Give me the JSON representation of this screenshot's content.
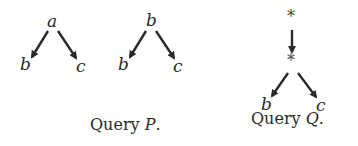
{
  "query_p": {
    "caption_word": "Query",
    "caption_var": "P",
    "caption_end": ".",
    "trees": [
      {
        "root": "a",
        "left": "b",
        "right": "c"
      },
      {
        "root": "b",
        "left": "b",
        "right": "c"
      }
    ]
  },
  "query_q": {
    "caption_word": "Query",
    "caption_var": "Q",
    "caption_end": ".",
    "top": "*",
    "middle": "*",
    "left": "b",
    "right": "c"
  },
  "colors": {
    "ink": "#2a2a2a",
    "background": "#ffffff"
  }
}
